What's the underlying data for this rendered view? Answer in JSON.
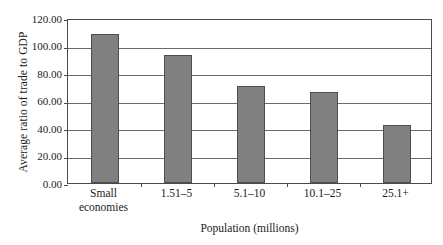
{
  "chart_data": {
    "type": "bar",
    "title": "",
    "xlabel": "Population (millions)",
    "ylabel": "Average ratio of trade to GDP",
    "categories": [
      "Small economies",
      "1.51–5",
      "5.1–10",
      "10.1–25",
      "25.1+"
    ],
    "category_lines": [
      [
        "Small",
        "economies"
      ],
      [
        "1.51–5"
      ],
      [
        "5.1–10"
      ],
      [
        "10.1–25"
      ],
      [
        "25.1+"
      ]
    ],
    "values": [
      108.7,
      92.8,
      70.4,
      66.1,
      42.4
    ],
    "ylim": [
      0,
      120
    ],
    "ytick_values": [
      0,
      20,
      40,
      60,
      80,
      100,
      120
    ],
    "ytick_labels": [
      "0.00",
      "20.00",
      "40.00",
      "60.00",
      "80.00",
      "100.00",
      "120.00"
    ],
    "grid": true,
    "grid_axis": "y",
    "legend": "none",
    "bar_color": "#808080",
    "bar_border_color": "#4f4f4f",
    "axis_color": "#4a4a4a",
    "background_color": "#ffffff"
  }
}
